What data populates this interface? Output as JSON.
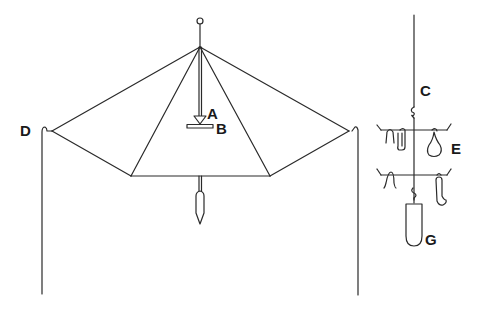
{
  "diagram": {
    "background": "#ffffff",
    "stroke_color": "#2a2a2a",
    "labels": {
      "A": "A",
      "B": "B",
      "C": "C",
      "D": "D",
      "E": "E",
      "G": "G"
    },
    "components": {
      "umbrella_frame": "umbrella-shaped pyramidal frame on a central mast",
      "support_poles": "two vertical poles",
      "hanging_assembly": "suspended string with two crossbars holding hooks and weights"
    }
  }
}
